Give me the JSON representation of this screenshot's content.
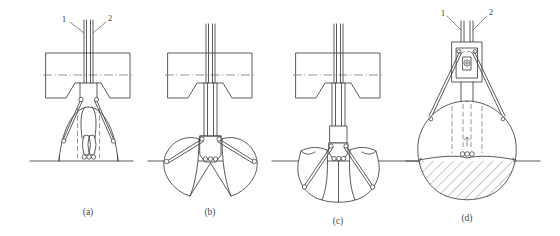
{
  "figure": {
    "background_color": "#ffffff",
    "line_color": "#3d3d3d",
    "text_color": "#4a4a4a",
    "ground_line_label": "ground-line"
  },
  "callouts": {
    "rope_1": "1",
    "rope_2": "2"
  },
  "panels": [
    {
      "id": "a",
      "caption": "(a)",
      "state": "closed bucket resting on material surface, holding ropes slack"
    },
    {
      "id": "b",
      "caption": "(b)",
      "state": "bucket fully open, shells spread apart"
    },
    {
      "id": "c",
      "caption": "(c)",
      "state": "bucket closing while digging into material"
    },
    {
      "id": "d",
      "caption": "(d)",
      "state": "bucket closed and full, lifted with load"
    }
  ]
}
